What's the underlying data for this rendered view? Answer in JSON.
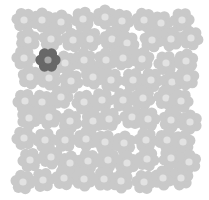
{
  "puzzle": {
    "type": "find-the-odd-one",
    "grid": {
      "cols": 9,
      "rows": 9,
      "origin_x": 24,
      "origin_y": 20,
      "pitch_x": 20,
      "pitch_y": 20,
      "jitter": 3
    },
    "colors": {
      "background": "#ffffff",
      "petal": "#c9c9c9",
      "center": "#e2e2e2",
      "odd_petal": "#686868",
      "odd_center": "#a8a8a8"
    },
    "odd_one": {
      "x": 48,
      "y": 60
    },
    "icon": "flower-icon"
  }
}
